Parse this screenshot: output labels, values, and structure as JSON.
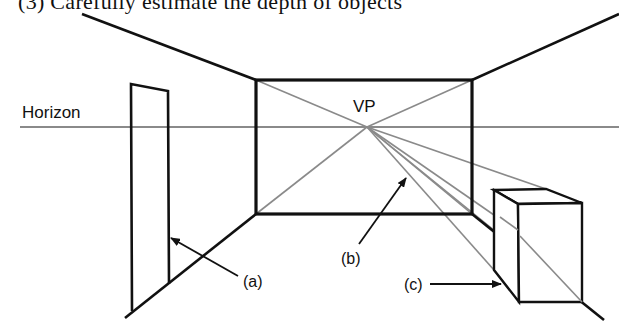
{
  "caption": "(3)  Carefully estimate the depth of objects",
  "diagram": {
    "horizon_label": "Horizon",
    "vp_label": "VP",
    "callouts": [
      {
        "id": "a",
        "label": "(a)"
      },
      {
        "id": "b",
        "label": "(b)"
      },
      {
        "id": "c",
        "label": "(c)"
      }
    ],
    "colors": {
      "structure": "#111111",
      "construction_lines": "#8a8a8a"
    }
  }
}
